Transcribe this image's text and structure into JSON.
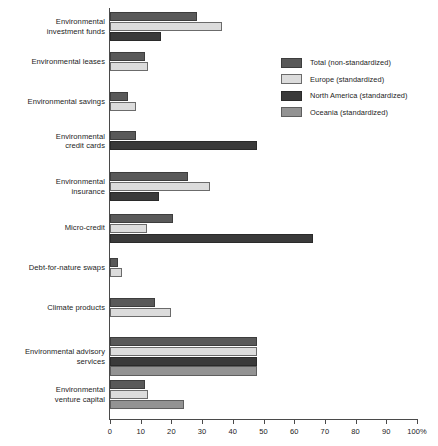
{
  "chart_data": {
    "type": "bar",
    "orientation": "horizontal",
    "title": "",
    "subtitle": "",
    "xlabel": "",
    "ylabel": "",
    "xlim": [
      0,
      100
    ],
    "xticks": [
      0,
      10,
      20,
      30,
      40,
      50,
      60,
      70,
      80,
      90,
      100
    ],
    "xtick_labels": [
      "0",
      "10",
      "20",
      "30",
      "40",
      "50",
      "60",
      "70",
      "80",
      "90",
      "100%"
    ],
    "grid": false,
    "legend_position": "upper right",
    "unit": "%",
    "categories": [
      "Environmental investment funds",
      "Environmental leases",
      "Environmental savings",
      "Environmental credit cards",
      "Environmental insurance",
      "Micro-credit",
      "Debt-for-nature swaps",
      "Climate products",
      "Environmental advisory services",
      "Environmental venture capital"
    ],
    "category_label_lines": [
      [
        "Environmental",
        "investment funds"
      ],
      [
        "Environmental leases"
      ],
      [
        "Environmental savings"
      ],
      [
        "Environmental",
        "credit cards"
      ],
      [
        "Environmental",
        "insurance"
      ],
      [
        "Micro-credit"
      ],
      [
        "Debt-for-nature swaps"
      ],
      [
        "Climate products"
      ],
      [
        "Environmental advisory",
        "services"
      ],
      [
        "Environmental",
        "venture capital"
      ]
    ],
    "series": [
      {
        "name": "Total (non-standardized)",
        "key": "total",
        "color": "#595959",
        "values": [
          28.5,
          11.5,
          6.0,
          8.5,
          25.5,
          20.5,
          2.5,
          14.5,
          48.0,
          11.5
        ]
      },
      {
        "name": "Europe (standardized)",
        "key": "europe",
        "color": "#dcdcdc",
        "values": [
          36.5,
          12.5,
          8.5,
          null,
          32.5,
          12.0,
          4.0,
          20.0,
          48.0,
          12.5
        ]
      },
      {
        "name": "North America (standardized)",
        "key": "northamerica",
        "color": "#3a3a3a",
        "values": [
          16.5,
          null,
          null,
          48.0,
          16.0,
          66.0,
          null,
          null,
          48.0,
          null
        ]
      },
      {
        "name": "Oceania (standardized)",
        "key": "oceania",
        "color": "#939393",
        "values": [
          null,
          null,
          null,
          null,
          null,
          null,
          null,
          null,
          48.0,
          24.0
        ]
      }
    ]
  },
  "legend": {
    "items": [
      {
        "label": "Total (non-standardized)",
        "key": "total"
      },
      {
        "label": "Europe (standardized)",
        "key": "europe"
      },
      {
        "label": "North America (standardized)",
        "key": "northamerica"
      },
      {
        "label": "Oceania (standardized)",
        "key": "oceania"
      }
    ]
  }
}
